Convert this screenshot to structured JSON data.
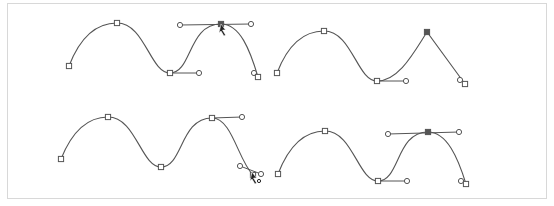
{
  "figure": {
    "colors": {
      "stroke": "#555555",
      "frame_border": "#d8d8d8",
      "background": "#ffffff",
      "selected_anchor": "#555555"
    },
    "panels": [
      {
        "id": "top-left",
        "curve": "M69,66 C79,40 95,23 117,23 C145,23 150,73 170,73 C192,73 188,24 221,24 C240,24 250,50 258,77",
        "anchors": [
          [
            69,
            66
          ],
          [
            117,
            23
          ],
          [
            170,
            73
          ],
          [
            221,
            24
          ],
          [
            258,
            77
          ]
        ],
        "selected_anchor": 3,
        "handle_lines": [
          [
            [
              170,
              73
            ],
            [
              199,
              73
            ]
          ],
          [
            [
              180,
              25
            ],
            [
              251,
              24
            ]
          ]
        ],
        "handles": [
          [
            199,
            73
          ],
          [
            180,
            25
          ],
          [
            251,
            24
          ],
          [
            254,
            73
          ]
        ],
        "cursor": [
          221,
          24
        ]
      },
      {
        "id": "top-right",
        "curve": "M277,73 C287,47 302,31 324,31 C352,31 357,81 377,81 C399,81 414,52 427,32 L465,84",
        "anchors": [
          [
            277,
            73
          ],
          [
            324,
            31
          ],
          [
            377,
            81
          ],
          [
            427,
            32
          ],
          [
            465,
            84
          ]
        ],
        "selected_anchor": 3,
        "handle_lines": [
          [
            [
              377,
              81
            ],
            [
              406,
              81
            ]
          ]
        ],
        "handles": [
          [
            406,
            81
          ],
          [
            460,
            80
          ]
        ]
      },
      {
        "id": "bottom-left",
        "curve": "M61,159 C71,134 86,117 108,117 C136,117 141,167 161,167 C183,167 180,118 212,118 C232,118 238,160 253,175",
        "anchors": [
          [
            61,
            159
          ],
          [
            108,
            117
          ],
          [
            161,
            167
          ],
          [
            212,
            118
          ],
          [
            253,
            175
          ]
        ],
        "selected_anchor": null,
        "handle_lines": [
          [
            [
              212,
              118
            ],
            [
              242,
              117
            ]
          ],
          [
            [
              240,
              166
            ],
            [
              261,
              174
            ]
          ]
        ],
        "handles": [
          [
            242,
            117
          ],
          [
            240,
            166
          ],
          [
            261,
            174
          ]
        ],
        "cursor": [
          252,
          172
        ]
      },
      {
        "id": "bottom-right",
        "curve": "M278,174 C288,148 303,131 325,131 C353,131 358,181 378,181 C400,181 396,132 428,132 C447,132 458,158 466,184",
        "anchors": [
          [
            278,
            174
          ],
          [
            325,
            131
          ],
          [
            378,
            181
          ],
          [
            428,
            132
          ],
          [
            466,
            184
          ]
        ],
        "selected_anchor": 3,
        "handle_lines": [
          [
            [
              378,
              181
            ],
            [
              407,
              181
            ]
          ],
          [
            [
              388,
              134
            ],
            [
              459,
              132
            ]
          ]
        ],
        "handles": [
          [
            407,
            181
          ],
          [
            388,
            134
          ],
          [
            459,
            132
          ],
          [
            461,
            181
          ]
        ]
      }
    ]
  }
}
